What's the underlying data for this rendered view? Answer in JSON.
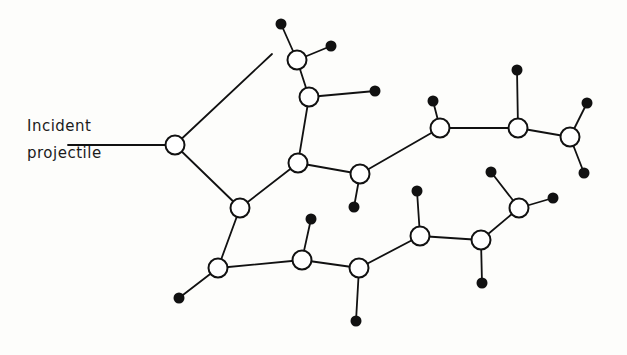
{
  "figure": {
    "title_label_line1": "Incident",
    "title_label_line2": "projectile",
    "colors": {
      "ink": "#111111",
      "background": "#fdfdfb",
      "node_fill": "#ffffff",
      "dot_fill": "#111111"
    },
    "style": {
      "node_radius": 9.5,
      "dot_radius": 5.5,
      "stroke_width": 1.8,
      "node_stroke_width": 2.0
    }
  },
  "chart_data": {
    "type": "diagram",
    "nodes": [
      {
        "id": "n1",
        "x": 175,
        "y": 145,
        "type": "open"
      },
      {
        "id": "n2",
        "x": 240,
        "y": 208,
        "type": "open"
      },
      {
        "id": "n3",
        "x": 297,
        "y": 60,
        "type": "open"
      },
      {
        "id": "n4",
        "x": 309,
        "y": 97,
        "type": "open"
      },
      {
        "id": "n5",
        "x": 298,
        "y": 163,
        "type": "open"
      },
      {
        "id": "n6",
        "x": 360,
        "y": 174,
        "type": "open"
      },
      {
        "id": "n7",
        "x": 440,
        "y": 128,
        "type": "open"
      },
      {
        "id": "n8",
        "x": 518,
        "y": 128,
        "type": "open"
      },
      {
        "id": "n9",
        "x": 570,
        "y": 137,
        "type": "open"
      },
      {
        "id": "n10",
        "x": 218,
        "y": 268,
        "type": "open"
      },
      {
        "id": "n11",
        "x": 302,
        "y": 260,
        "type": "open"
      },
      {
        "id": "n12",
        "x": 359,
        "y": 268,
        "type": "open"
      },
      {
        "id": "n13",
        "x": 420,
        "y": 236,
        "type": "open"
      },
      {
        "id": "n14",
        "x": 481,
        "y": 240,
        "type": "open"
      },
      {
        "id": "n15",
        "x": 519,
        "y": 208,
        "type": "open"
      }
    ],
    "dots": [
      {
        "id": "d1",
        "x": 281,
        "y": 24
      },
      {
        "id": "d2",
        "x": 331,
        "y": 46
      },
      {
        "id": "d3",
        "x": 375,
        "y": 91
      },
      {
        "id": "d4",
        "x": 354,
        "y": 207
      },
      {
        "id": "d5",
        "x": 433,
        "y": 101
      },
      {
        "id": "d6",
        "x": 517,
        "y": 70
      },
      {
        "id": "d7",
        "x": 587,
        "y": 103
      },
      {
        "id": "d8",
        "x": 584,
        "y": 173
      },
      {
        "id": "d9",
        "x": 491,
        "y": 172
      },
      {
        "id": "d10",
        "x": 417,
        "y": 191
      },
      {
        "id": "d11",
        "x": 553,
        "y": 198
      },
      {
        "id": "d12",
        "x": 482,
        "y": 283
      },
      {
        "id": "d13",
        "x": 311,
        "y": 219
      },
      {
        "id": "d14",
        "x": 356,
        "y": 321
      },
      {
        "id": "d15",
        "x": 179,
        "y": 298
      }
    ],
    "edges": [
      {
        "from": "incident_arrow_start",
        "to": "n1",
        "x1": 68,
        "y1": 145,
        "x2": 175,
        "y2": 145,
        "kind": "incident"
      },
      {
        "from": "n1",
        "to": "free_end_top",
        "x1": 175,
        "y1": 145,
        "x2": 272,
        "y2": 54,
        "kind": "recoil"
      },
      {
        "from": "n1",
        "to": "n2",
        "kind": "recoil"
      },
      {
        "from": "n2",
        "to": "n5",
        "kind": "recoil"
      },
      {
        "from": "n2",
        "to": "n10",
        "kind": "recoil"
      },
      {
        "from": "n3",
        "to": "d1",
        "kind": "recoil"
      },
      {
        "from": "n3",
        "to": "d2",
        "kind": "recoil"
      },
      {
        "from": "n3",
        "to": "n4",
        "kind": "recoil"
      },
      {
        "from": "n4",
        "to": "d3",
        "kind": "recoil"
      },
      {
        "from": "n4",
        "to": "n5",
        "kind": "recoil"
      },
      {
        "from": "n5",
        "to": "n6",
        "kind": "recoil"
      },
      {
        "from": "n6",
        "to": "d4",
        "kind": "recoil"
      },
      {
        "from": "n6",
        "to": "n7",
        "kind": "recoil"
      },
      {
        "from": "n7",
        "to": "d5",
        "kind": "recoil"
      },
      {
        "from": "n7",
        "to": "n8",
        "kind": "recoil"
      },
      {
        "from": "n8",
        "to": "d6",
        "kind": "recoil"
      },
      {
        "from": "n8",
        "to": "n9",
        "kind": "recoil"
      },
      {
        "from": "n9",
        "to": "d7",
        "kind": "recoil"
      },
      {
        "from": "n9",
        "to": "d8",
        "kind": "recoil"
      },
      {
        "from": "n10",
        "to": "d15",
        "kind": "recoil"
      },
      {
        "from": "n10",
        "to": "n11",
        "kind": "recoil"
      },
      {
        "from": "n11",
        "to": "d13",
        "kind": "recoil"
      },
      {
        "from": "n11",
        "to": "n12",
        "kind": "recoil"
      },
      {
        "from": "n12",
        "to": "d14",
        "kind": "recoil"
      },
      {
        "from": "n12",
        "to": "n13",
        "kind": "recoil"
      },
      {
        "from": "n13",
        "to": "d10",
        "kind": "recoil"
      },
      {
        "from": "n13",
        "to": "n14",
        "kind": "recoil"
      },
      {
        "from": "n14",
        "to": "d12",
        "kind": "recoil"
      },
      {
        "from": "n14",
        "to": "n15",
        "kind": "recoil"
      },
      {
        "from": "n15",
        "to": "d11",
        "kind": "recoil"
      },
      {
        "from": "n15",
        "to": "d9",
        "kind": "recoil"
      }
    ],
    "legend": [],
    "xlabel": "",
    "ylabel": ""
  }
}
